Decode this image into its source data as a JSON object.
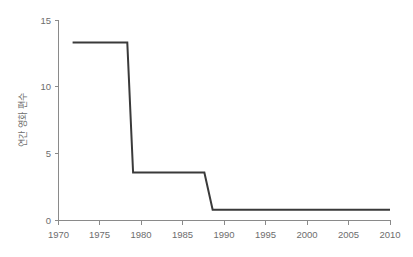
{
  "chart_data": {
    "type": "line",
    "title": "",
    "subtitle": "",
    "xlabel": "",
    "ylabel": "연간 영화 편수",
    "xlim": [
      1970,
      2010
    ],
    "ylim": [
      0,
      15
    ],
    "grid": false,
    "legend": null,
    "line_color": "#3a3a3a",
    "axis_color": "#8a8a8a",
    "tick_label_color": "#6d6d6d",
    "background_color": "#ffffff",
    "xticks": [
      1970,
      1975,
      1980,
      1985,
      1990,
      1995,
      2000,
      2005,
      2010
    ],
    "xtick_labels": [
      "1970",
      "1975",
      "1980",
      "1985",
      "1990",
      "1995",
      "2000",
      "2005",
      "2010"
    ],
    "yticks": [
      0,
      5,
      10,
      15
    ],
    "ytick_labels": [
      "0",
      "5",
      "10",
      "15"
    ],
    "series": [
      {
        "name": "연간 영화 편수",
        "x": [
          1971.7,
          1978.3,
          1979.0,
          1987.6,
          1988.6,
          2010.0
        ],
        "y": [
          13.35,
          13.35,
          3.6,
          3.6,
          0.8,
          0.8
        ]
      }
    ],
    "annotations": []
  }
}
